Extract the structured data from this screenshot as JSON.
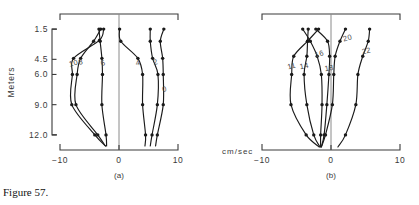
{
  "figure": {
    "caption": "Figure 57.",
    "units_label": "cm/sec",
    "y_axis_label": "Meters"
  },
  "chart_data": {
    "type": "line",
    "title": "Figure 57.",
    "xlabel": "cm/sec",
    "ylabel": "Meters",
    "xlim": [
      -10,
      10
    ],
    "ylim": [
      0,
      13.5
    ],
    "grid": false,
    "legend": "inline-curve-labels",
    "orientation": "vertical-depth-profile",
    "x_ticks": [
      "-10",
      "0",
      "10"
    ],
    "x_tick_values": [
      -10,
      0,
      10
    ],
    "y_ticks": [
      "1.5",
      "4.5",
      "6.0",
      "9.0",
      "12.0"
    ],
    "y_tick_values": [
      1.5,
      4.5,
      6.0,
      9.0,
      12.0
    ],
    "panels": [
      {
        "id": "a",
        "label": "(a)",
        "series": [
          {
            "name": "10",
            "label_x": -7.6,
            "label_y": 5.1,
            "x": [
              -2.6,
              -3.3,
              -7.7,
              -7.9,
              -8.0,
              -4.1,
              -2.3
            ],
            "y": [
              1.5,
              2.6,
              4.4,
              6.0,
              9.0,
              12.0,
              13.1
            ]
          },
          {
            "name": "8",
            "label_x": -6.4,
            "label_y": 5.0,
            "x": [
              -3.1,
              -4.3,
              -6.5,
              -7.1,
              -7.3,
              -3.6,
              -2.3
            ],
            "y": [
              1.5,
              2.7,
              4.4,
              6.0,
              9.0,
              12.0,
              13.1
            ]
          },
          {
            "name": "6",
            "label_x": -2.6,
            "label_y": 5.1,
            "x": [
              -3.4,
              -3.2,
              -2.9,
              -2.8,
              -2.9,
              -2.2,
              -2.1
            ],
            "y": [
              1.5,
              2.7,
              4.4,
              6.0,
              9.0,
              12.0,
              13.1
            ]
          },
          {
            "name": "4",
            "label_x": 3.3,
            "label_y": 5.1,
            "x": [
              0.1,
              0.3,
              3.2,
              4.0,
              4.0,
              4.5,
              4.4
            ],
            "y": [
              1.5,
              2.7,
              4.4,
              6.0,
              9.0,
              12.0,
              13.1
            ]
          },
          {
            "name": "2",
            "label_x": 6.3,
            "label_y": 5.0,
            "x": [
              5.3,
              5.3,
              5.7,
              6.6,
              6.5,
              5.6,
              5.3
            ],
            "y": [
              1.5,
              2.7,
              4.4,
              6.0,
              9.0,
              12.0,
              13.1
            ]
          },
          {
            "name": "0",
            "label_x": 7.8,
            "label_y": 7.7,
            "x": [
              7.6,
              7.0,
              7.4,
              7.5,
              7.5,
              6.5,
              6.2
            ],
            "y": [
              1.5,
              2.7,
              4.4,
              6.0,
              9.0,
              12.0,
              13.1
            ]
          }
        ]
      },
      {
        "id": "b",
        "label": "(b)",
        "series": [
          {
            "name": "11",
            "label_x": -5.6,
            "label_y": 5.4,
            "x": [
              -1.8,
              -3.4,
              -5.4,
              -5.7,
              -5.8,
              -3.6,
              -1.7
            ],
            "y": [
              1.5,
              2.7,
              4.2,
              6.0,
              9.0,
              12.0,
              13.2
            ]
          },
          {
            "name": "14",
            "label_x": -3.8,
            "label_y": 5.4,
            "x": [
              -3.3,
              -3.4,
              -3.5,
              -3.9,
              -3.5,
              -2.5,
              -1.6
            ],
            "y": [
              1.5,
              2.7,
              4.2,
              6.0,
              9.0,
              12.0,
              13.2
            ]
          },
          {
            "name": "16",
            "label_x": -1.6,
            "label_y": 4.2,
            "x": [
              -4.1,
              -3.0,
              -2.0,
              -1.4,
              -1.3,
              -1.5,
              -1.5
            ],
            "y": [
              1.5,
              2.7,
              4.2,
              6.0,
              9.0,
              12.0,
              13.2
            ]
          },
          {
            "name": "18",
            "label_x": -0.2,
            "label_y": 5.6,
            "x": [
              -2.2,
              -0.5,
              -0.2,
              -0.3,
              -0.6,
              -1.0,
              -1.4
            ],
            "y": [
              1.5,
              2.7,
              4.2,
              6.0,
              9.0,
              12.0,
              13.2
            ]
          },
          {
            "name": "20",
            "label_x": 2.5,
            "label_y": 2.6,
            "x": [
              2.1,
              1.3,
              0.6,
              0.4,
              0.2,
              -0.8,
              -1.4
            ],
            "y": [
              1.5,
              2.7,
              4.2,
              6.0,
              9.0,
              12.0,
              13.2
            ]
          },
          {
            "name": "22",
            "label_x": 5.2,
            "label_y": 3.9,
            "x": [
              5.6,
              5.4,
              4.6,
              3.9,
              3.6,
              2.1,
              1.0
            ],
            "y": [
              1.5,
              2.7,
              4.2,
              6.0,
              9.0,
              12.0,
              13.2
            ]
          }
        ]
      }
    ]
  },
  "colors": {
    "ink": "#1a1a1a",
    "axis": "#3a3a3a",
    "background": "#ffffff"
  }
}
